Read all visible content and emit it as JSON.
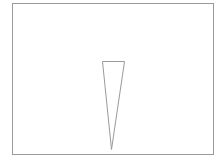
{
  "diagram": {
    "canvas": {
      "width": 221,
      "height": 162,
      "background": "#ffffff"
    },
    "stroke_color": "#9a9a9a",
    "frame": {
      "x1": 12.5,
      "y1": 3.5,
      "x2": 213.5,
      "y2": 154.5
    },
    "triangle": {
      "points": "102.5,61.5 124.5,61.5 111.5,149.5",
      "orientation": "inverted"
    }
  }
}
